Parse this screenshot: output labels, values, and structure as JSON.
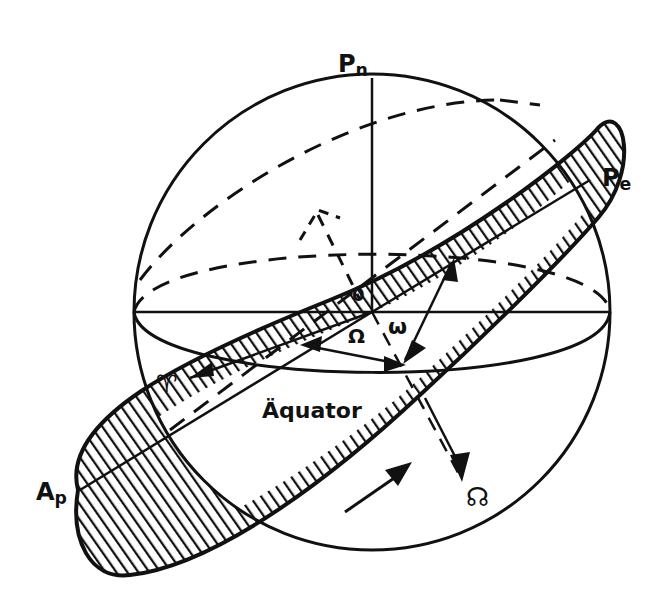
{
  "diagram": {
    "type": "celestial-sphere-orbital-elements",
    "labels": {
      "north_pole": {
        "main": "P",
        "sub": "n"
      },
      "perihelion": {
        "main": "P",
        "sub": "e"
      },
      "aphelion": {
        "main": "A",
        "sub": "p"
      },
      "center": "0",
      "ascending_node_longitude": "Ω",
      "argument_of_perihelion": "ω",
      "vernal_equinox": "♈",
      "equator": "Äquator",
      "descending_node": "☊"
    },
    "colors": {
      "ink": "#111111",
      "background": "#ffffff"
    }
  }
}
